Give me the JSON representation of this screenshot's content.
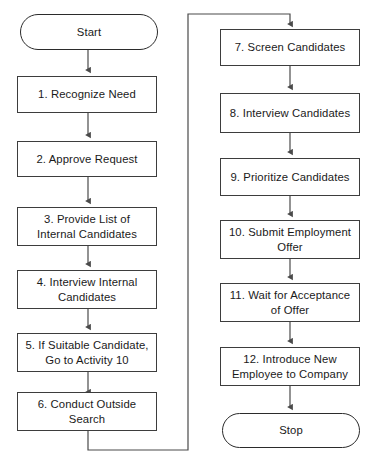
{
  "diagram": {
    "colors": {
      "background": "#ffffff",
      "stroke": "#3d3d3d",
      "text": "#1a1a1a",
      "connector": "#4a4a4a"
    },
    "start_label": "Start",
    "stop_label": "Stop",
    "left_column": [
      {
        "id": "step-1",
        "number": "1.",
        "text": "1. Recognize Need"
      },
      {
        "id": "step-2",
        "number": "2.",
        "text": "2. Approve Request"
      },
      {
        "id": "step-3",
        "number": "3.",
        "text": "3. Provide List of\nInternal Candidates"
      },
      {
        "id": "step-4",
        "number": "4.",
        "text": "4. Interview Internal\nCandidates"
      },
      {
        "id": "step-5",
        "number": "5.",
        "text": "5. If Suitable Candidate,\nGo to Activity 10"
      },
      {
        "id": "step-6",
        "number": "6.",
        "text": "6. Conduct Outside\nSearch"
      }
    ],
    "right_column": [
      {
        "id": "step-7",
        "number": "7.",
        "text": "7. Screen Candidates"
      },
      {
        "id": "step-8",
        "number": "8.",
        "text": "8. Interview Candidates"
      },
      {
        "id": "step-9",
        "number": "9.",
        "text": "9. Prioritize Candidates"
      },
      {
        "id": "step-10",
        "number": "10.",
        "text": "10. Submit Employment\nOffer"
      },
      {
        "id": "step-11",
        "number": "11.",
        "text": "11. Wait for Acceptance\nof Offer"
      },
      {
        "id": "step-12",
        "number": "12.",
        "text": "12. Introduce New\nEmployee to Company"
      }
    ]
  }
}
